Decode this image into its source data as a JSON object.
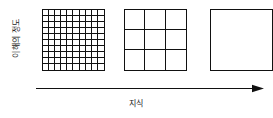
{
  "axes": {
    "y_label": "이해의 정도",
    "x_label": "지식",
    "arrow_icon": "arrow-right-icon"
  },
  "colors": {
    "line": "#111111",
    "text": "#1a1a1a",
    "background": "#ffffff"
  },
  "chart_data": {
    "type": "diagram",
    "title": "",
    "xlabel": "지식",
    "ylabel": "이해의 정도",
    "grid": true,
    "legend": "none",
    "categories": [
      "fine",
      "medium",
      "coarse"
    ],
    "series": [
      {
        "name": "grid subdivisions per side",
        "values": [
          10,
          3,
          1
        ]
      },
      {
        "name": "total cells",
        "values": [
          100,
          9,
          1
        ]
      }
    ],
    "squares": [
      {
        "name": "fine-grid-square",
        "divisions": 10,
        "cells": 100
      },
      {
        "name": "medium-grid-square",
        "divisions": 3,
        "cells": 9
      },
      {
        "name": "coarse-grid-square",
        "divisions": 1,
        "cells": 1
      }
    ]
  }
}
